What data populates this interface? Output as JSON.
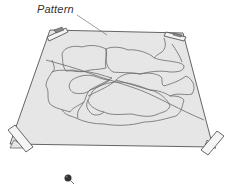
{
  "figure": {
    "label": "Pattern",
    "colors": {
      "paper": "#e6e6e6",
      "outline": "#555555",
      "pattern_line": "#6a6a6a",
      "tape": "#f4f4f4",
      "tape_outline": "#444444",
      "pin": "#333333"
    },
    "icons": [
      "tape-icon",
      "pushpin-icon"
    ]
  }
}
